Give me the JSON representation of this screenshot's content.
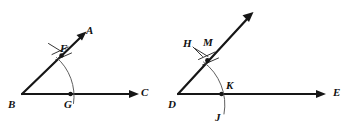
{
  "figure": {
    "background_color": "#ffffff",
    "line_color": "#161616",
    "arc_color": "#5f5f5f",
    "label_color": "#111111",
    "width": 359,
    "height": 131
  },
  "diagrams": [
    {
      "name": "angle-abc",
      "vertex": "B",
      "labels": {
        "vertex": "B",
        "upper_ray_end": "A",
        "lower_ray_end": "C",
        "arc_upper_intersection": "F",
        "arc_lower_intersection": "G"
      }
    },
    {
      "name": "angle-dme",
      "vertex": "D",
      "labels": {
        "vertex": "D",
        "upper_ray_end": "",
        "lower_ray_end": "E",
        "arc_upper_intersection": "M",
        "arc_upper_tick_label": "H",
        "arc_lower_intersection": "K",
        "arc_lower_end": "J"
      }
    }
  ],
  "labels": {
    "A": "A",
    "B": "B",
    "C": "C",
    "D": "D",
    "E": "E",
    "F": "F",
    "G": "G",
    "H": "H",
    "J": "J",
    "K": "K",
    "M": "M"
  }
}
